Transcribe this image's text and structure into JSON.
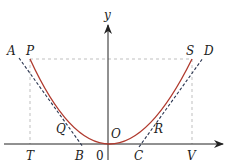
{
  "diagram": {
    "colors": {
      "curve": "#b03a2e",
      "tangent": "#2a3550",
      "guide": "#b0b0b0",
      "axis": "#222222"
    },
    "axis_labels": {
      "y": "y"
    },
    "origin_label": "0",
    "points": {
      "A": "A",
      "P": "P",
      "S": "S",
      "D": "D",
      "Q": "Q",
      "R": "R",
      "O": "O",
      "T": "T",
      "B": "B",
      "C": "C",
      "V": "V"
    }
  }
}
